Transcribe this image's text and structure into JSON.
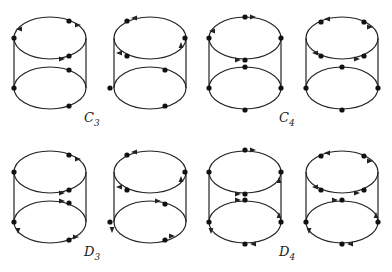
{
  "figure": {
    "groups": [
      {
        "label": "C",
        "subscript": "3",
        "pos": [
          84,
          120
        ]
      },
      {
        "label": "C",
        "subscript": "4",
        "pos": [
          279,
          120
        ]
      },
      {
        "label": "D",
        "subscript": "3",
        "pos": [
          84,
          254
        ]
      },
      {
        "label": "D",
        "subscript": "4",
        "pos": [
          279,
          254
        ]
      }
    ],
    "cylinders": [
      {
        "cx": 50,
        "top_y": 38,
        "bot_y": 88,
        "rx": 36,
        "ry": 21,
        "top_dots": [
          [
            69,
            21
          ],
          [
            14,
            38
          ],
          [
            69,
            56
          ]
        ],
        "bot_dots": [
          [
            69,
            70
          ],
          [
            14,
            88
          ],
          [
            69,
            106
          ]
        ],
        "top_arrows": [
          [
            78,
            25,
            "r"
          ],
          [
            19,
            29,
            "l"
          ],
          [
            62,
            59,
            "r"
          ]
        ],
        "bot_arrows": []
      },
      {
        "cx": 150,
        "top_y": 38,
        "bot_y": 88,
        "rx": 36,
        "ry": 21,
        "top_dots": [
          [
            127,
            21
          ],
          [
            185,
            38
          ],
          [
            127,
            56
          ]
        ],
        "bot_dots": [
          [
            165,
            70
          ],
          [
            110,
            88
          ],
          [
            165,
            106
          ]
        ],
        "top_arrows": [
          [
            134,
            18,
            "l"
          ],
          [
            181,
            45,
            "u"
          ],
          [
            119,
            53,
            "l"
          ]
        ],
        "bot_arrows": []
      },
      {
        "cx": 245,
        "top_y": 38,
        "bot_y": 88,
        "rx": 36,
        "ry": 21,
        "top_dots": [
          [
            245,
            17
          ],
          [
            209,
            38
          ],
          [
            281,
            38
          ],
          [
            245,
            60
          ]
        ],
        "bot_dots": [
          [
            245,
            67
          ],
          [
            209,
            88
          ],
          [
            281,
            88
          ],
          [
            245,
            110
          ]
        ],
        "top_arrows": [
          [
            253,
            17,
            "r"
          ],
          [
            212,
            31,
            "l"
          ],
          [
            238,
            60,
            "r"
          ]
        ],
        "bot_arrows": []
      },
      {
        "cx": 342,
        "top_y": 38,
        "bot_y": 88,
        "rx": 36,
        "ry": 21,
        "top_dots": [
          [
            321,
            22
          ],
          [
            364,
            22
          ],
          [
            321,
            56
          ],
          [
            364,
            56
          ]
        ],
        "bot_dots": [
          [
            342,
            67
          ],
          [
            306,
            88
          ],
          [
            378,
            88
          ],
          [
            342,
            110
          ]
        ],
        "top_arrows": [
          [
            327,
            19,
            "l"
          ],
          [
            370,
            27,
            "r"
          ],
          [
            315,
            53,
            "l"
          ],
          [
            357,
            59,
            "r"
          ]
        ],
        "bot_arrows": []
      },
      {
        "cx": 50,
        "top_y": 172,
        "bot_y": 222,
        "rx": 36,
        "ry": 21,
        "top_dots": [
          [
            69,
            155
          ],
          [
            14,
            172
          ],
          [
            69,
            190
          ]
        ],
        "bot_dots": [
          [
            69,
            203
          ],
          [
            14,
            222
          ],
          [
            69,
            240
          ]
        ],
        "top_arrows": [
          [
            78,
            159,
            "r"
          ],
          [
            62,
            193,
            "r"
          ]
        ],
        "bot_arrows": [
          [
            62,
            201,
            "r"
          ],
          [
            18,
            231,
            "d"
          ],
          [
            76,
            237,
            "r"
          ]
        ]
      },
      {
        "cx": 150,
        "top_y": 172,
        "bot_y": 222,
        "rx": 36,
        "ry": 21,
        "top_dots": [
          [
            127,
            155
          ],
          [
            185,
            172
          ],
          [
            127,
            190
          ]
        ],
        "bot_dots": [
          [
            165,
            204
          ],
          [
            110,
            222
          ],
          [
            165,
            240
          ]
        ],
        "top_arrows": [
          [
            134,
            152,
            "l"
          ],
          [
            181,
            179,
            "u"
          ],
          [
            119,
            187,
            "l"
          ]
        ],
        "bot_arrows": [
          [
            158,
            201,
            "r"
          ],
          [
            112,
            230,
            "d"
          ],
          [
            172,
            236,
            "r"
          ]
        ]
      },
      {
        "cx": 245,
        "top_y": 172,
        "bot_y": 222,
        "rx": 36,
        "ry": 21,
        "top_dots": [
          [
            245,
            150
          ],
          [
            209,
            172
          ],
          [
            281,
            172
          ],
          [
            245,
            194
          ]
        ],
        "bot_dots": [
          [
            245,
            200
          ],
          [
            209,
            222
          ],
          [
            281,
            222
          ],
          [
            245,
            244
          ]
        ],
        "top_arrows": [
          [
            253,
            150,
            "r"
          ],
          [
            238,
            194,
            "r"
          ],
          [
            279,
            180,
            "u"
          ]
        ],
        "bot_arrows": [
          [
            238,
            200,
            "r"
          ],
          [
            211,
            231,
            "d"
          ],
          [
            279,
            215,
            "u"
          ],
          [
            253,
            244,
            "l"
          ]
        ]
      },
      {
        "cx": 342,
        "top_y": 172,
        "bot_y": 222,
        "rx": 36,
        "ry": 21,
        "top_dots": [
          [
            321,
            156
          ],
          [
            364,
            156
          ],
          [
            321,
            190
          ],
          [
            364,
            190
          ]
        ],
        "bot_dots": [
          [
            342,
            200
          ],
          [
            306,
            222
          ],
          [
            378,
            222
          ],
          [
            342,
            244
          ]
        ],
        "top_arrows": [
          [
            327,
            153,
            "l"
          ],
          [
            370,
            161,
            "r"
          ],
          [
            315,
            187,
            "l"
          ],
          [
            357,
            193,
            "r"
          ]
        ],
        "bot_arrows": [
          [
            335,
            200,
            "r"
          ],
          [
            309,
            231,
            "d"
          ],
          [
            376,
            215,
            "u"
          ],
          [
            350,
            244,
            "l"
          ]
        ]
      }
    ],
    "style": {
      "stroke": "#222222",
      "dot": "#111111",
      "background": "#ffffff"
    }
  }
}
